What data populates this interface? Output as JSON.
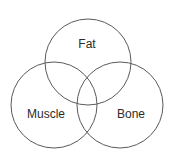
{
  "diagram": {
    "type": "venn",
    "circles": [
      {
        "name": "Fat",
        "label": "Fat",
        "cx": 88,
        "cy": 62,
        "r": 43
      },
      {
        "name": "Muscle",
        "label": "Muscle",
        "cx": 54,
        "cy": 105,
        "r": 43
      },
      {
        "name": "Bone",
        "label": "Bone",
        "cx": 120,
        "cy": 105,
        "r": 43
      }
    ],
    "stroke_color": "#5a5a5a",
    "text_color": "#2b2b2b"
  }
}
